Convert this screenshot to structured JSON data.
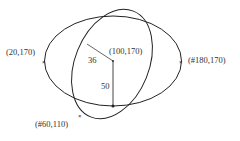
{
  "diagram": {
    "type": "ellipse-geometry",
    "colors": {
      "stroke": "#222222",
      "segment": "#666666",
      "text": "#333333"
    },
    "points": [
      {
        "id": "left",
        "label": "(20,170)"
      },
      {
        "id": "center",
        "label": "(100,170)"
      },
      {
        "id": "right",
        "label": "(#180,170)"
      },
      {
        "id": "bottom",
        "label": "(#60,110)"
      }
    ],
    "segments": [
      {
        "id": "minor",
        "label": "36"
      },
      {
        "id": "vertical",
        "label": "50"
      }
    ],
    "shapes": [
      {
        "id": "horizontal-ellipse"
      },
      {
        "id": "tilted-ellipse"
      }
    ]
  }
}
